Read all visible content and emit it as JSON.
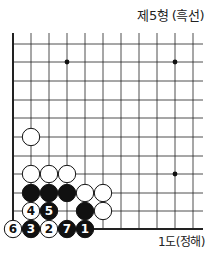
{
  "title": "제5형 (흑선)",
  "caption": "1도(정해)",
  "board": {
    "columns_x": [
      13,
      31,
      49,
      67,
      85,
      103,
      121,
      139,
      157,
      175,
      193
    ],
    "rows_y": [
      44,
      62,
      81,
      100,
      118,
      137,
      156,
      174,
      193,
      211,
      229
    ],
    "edges": [
      "left",
      "bottom"
    ],
    "star_points": [
      {
        "col": 3,
        "row": 1
      },
      {
        "col": 9,
        "row": 1
      },
      {
        "col": 9,
        "row": 7
      }
    ],
    "stones": [
      {
        "color": "white",
        "col": 1,
        "row": 5,
        "label": ""
      },
      {
        "color": "white",
        "col": 1,
        "row": 7,
        "label": ""
      },
      {
        "color": "white",
        "col": 2,
        "row": 7,
        "label": ""
      },
      {
        "color": "white",
        "col": 3,
        "row": 7,
        "label": ""
      },
      {
        "color": "black",
        "col": 1,
        "row": 8,
        "label": ""
      },
      {
        "color": "black",
        "col": 2,
        "row": 8,
        "label": ""
      },
      {
        "color": "black",
        "col": 3,
        "row": 8,
        "label": ""
      },
      {
        "color": "white",
        "col": 4,
        "row": 8,
        "label": ""
      },
      {
        "color": "white",
        "col": 5,
        "row": 8,
        "label": ""
      },
      {
        "color": "white",
        "col": 1,
        "row": 9,
        "label": "4"
      },
      {
        "color": "black",
        "col": 2,
        "row": 9,
        "label": "5"
      },
      {
        "color": "black",
        "col": 4,
        "row": 9,
        "label": ""
      },
      {
        "color": "white",
        "col": 5,
        "row": 9,
        "label": ""
      },
      {
        "color": "white",
        "col": 0,
        "row": 10,
        "label": "6"
      },
      {
        "color": "black",
        "col": 1,
        "row": 10,
        "label": "3"
      },
      {
        "color": "white",
        "col": 2,
        "row": 10,
        "label": "2"
      },
      {
        "color": "black",
        "col": 3,
        "row": 10,
        "label": "7"
      },
      {
        "color": "black",
        "col": 4,
        "row": 10,
        "label": "1"
      }
    ]
  }
}
